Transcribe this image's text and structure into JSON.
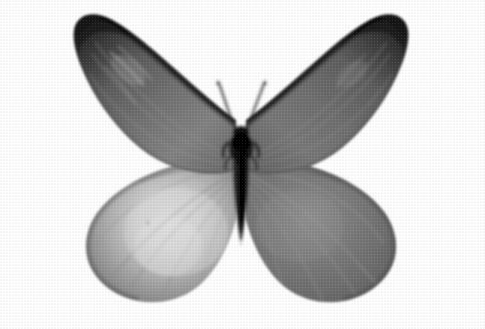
{
  "image": {
    "kind": "photograph",
    "subject": "butterfly-specimen",
    "view": "dorsal-wings-spread",
    "color_mode": "grayscale",
    "print_texture": "halftone-dot-screen",
    "width": 485,
    "height": 329,
    "background_color": "#ffffff",
    "alt_text": "Black and white halftone photograph of a butterfly specimen with wings spread, showing hooked forewing tips and rounded hindwings"
  },
  "palette": {
    "background": "#ffffff",
    "body_black": "#111111",
    "wingtip_dark": "#2b2b2b",
    "forewing_mid": "#6e6e6e",
    "forewing_light": "#8d8d8d",
    "hindwing_dark": "#6a6a6a",
    "hindwing_pale": "#c9c9c9",
    "hindwing_highlight": "#d8d8d8",
    "vein_dark": "#4a4a4a",
    "vein_light": "#b5b5b5",
    "edge_line": "#1d1d1d",
    "antenna": "#3a3a3a"
  },
  "subject_geometry": {
    "wingspan_left_x": 72,
    "wingspan_right_x": 410,
    "apex_top_y": 14,
    "hindwing_bottom_y": 302,
    "body_center_x": 241,
    "thorax_top_y": 126,
    "abdomen_tip_y": 245,
    "antenna_tip_y": 82
  },
  "anatomy": [
    {
      "id": "left-forewing",
      "label": "Left forewing",
      "tone": "mid-gray with dark hooked apex"
    },
    {
      "id": "right-forewing",
      "label": "Right forewing",
      "tone": "mid-gray with dark hooked apex"
    },
    {
      "id": "left-hindwing",
      "label": "Left hindwing",
      "tone": "pale center with radiating veins"
    },
    {
      "id": "right-hindwing",
      "label": "Right hindwing",
      "tone": "uniform darker gray, scalloped margin"
    },
    {
      "id": "thorax",
      "label": "Thorax",
      "tone": "black, fuzzy scales"
    },
    {
      "id": "abdomen",
      "label": "Abdomen",
      "tone": "black tapering segment"
    },
    {
      "id": "antennae",
      "label": "Antennae",
      "tone": "thin paired V filaments"
    }
  ]
}
